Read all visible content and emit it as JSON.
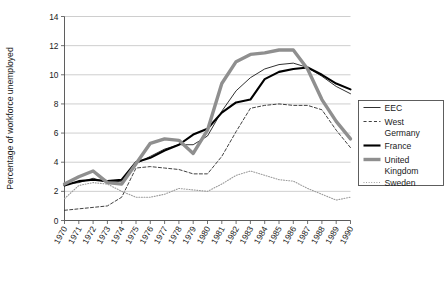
{
  "chart_data": {
    "type": "line",
    "title": "",
    "xlabel": "",
    "ylabel": "Percentage of workforce unemployed",
    "ylim": [
      0,
      14
    ],
    "yticks": [
      0,
      2,
      4,
      6,
      8,
      10,
      12,
      14
    ],
    "ytick_labels": [
      "0",
      "2",
      "4",
      "6",
      "8",
      "10",
      "12",
      "14"
    ],
    "grid": true,
    "grid_axis": "y",
    "legend_position": "right",
    "x": [
      1970,
      1971,
      1972,
      1973,
      1974,
      1975,
      1976,
      1977,
      1978,
      1979,
      1980,
      1981,
      1982,
      1983,
      1984,
      1985,
      1986,
      1987,
      1988,
      1989,
      1990
    ],
    "categories": [
      "1970",
      "1971",
      "1972",
      "1973",
      "1974",
      "1975",
      "1976",
      "1977",
      "1978",
      "1979",
      "1980",
      "1981",
      "1982",
      "1983",
      "1984",
      "1985",
      "1986",
      "1987",
      "1988",
      "1989",
      "1990"
    ],
    "series": [
      {
        "name": "EEC",
        "style": "solid-thin",
        "color": "#1a1a1a",
        "width": 0.9,
        "values": [
          2.5,
          2.6,
          2.9,
          2.6,
          2.7,
          3.9,
          4.4,
          4.9,
          5.2,
          5.2,
          5.8,
          7.5,
          8.9,
          9.8,
          10.4,
          10.7,
          10.8,
          10.5,
          9.9,
          9.2,
          8.7
        ]
      },
      {
        "name": "West Germany",
        "style": "dashed",
        "color": "#2b2b2b",
        "width": 0.9,
        "values": [
          0.7,
          0.8,
          0.9,
          1.0,
          1.6,
          3.6,
          3.7,
          3.6,
          3.5,
          3.2,
          3.2,
          4.4,
          6.1,
          7.7,
          7.9,
          8.0,
          7.9,
          7.9,
          7.6,
          6.2,
          5.0
        ]
      },
      {
        "name": "France",
        "style": "solid-thick",
        "color": "#000000",
        "width": 2.1,
        "values": [
          2.4,
          2.7,
          2.8,
          2.7,
          2.8,
          4.0,
          4.3,
          4.8,
          5.2,
          5.9,
          6.3,
          7.4,
          8.1,
          8.3,
          9.7,
          10.2,
          10.4,
          10.5,
          10.0,
          9.4,
          9.0
        ]
      },
      {
        "name": "United Kingdom",
        "style": "solid-thick-gray",
        "color": "#8f8f8f",
        "width": 3.4,
        "values": [
          2.5,
          3.0,
          3.4,
          2.6,
          2.5,
          3.9,
          5.3,
          5.6,
          5.5,
          4.6,
          6.2,
          9.4,
          10.9,
          11.4,
          11.5,
          11.7,
          11.7,
          10.4,
          8.3,
          6.8,
          5.6
        ]
      },
      {
        "name": "Sweden",
        "style": "dotted",
        "color": "#9a9a9a",
        "width": 1.1,
        "values": [
          1.5,
          2.4,
          2.6,
          2.5,
          2.0,
          1.6,
          1.6,
          1.8,
          2.2,
          2.1,
          2.0,
          2.5,
          3.1,
          3.4,
          3.1,
          2.8,
          2.7,
          2.2,
          1.8,
          1.4,
          1.6
        ]
      }
    ]
  },
  "legend": {
    "entries": [
      {
        "label": "EEC",
        "label_line2": ""
      },
      {
        "label": "West",
        "label_line2": "Germany"
      },
      {
        "label": "France",
        "label_line2": ""
      },
      {
        "label": "United",
        "label_line2": "Kingdom"
      },
      {
        "label": "Sweden",
        "label_line2": ""
      }
    ]
  },
  "colors": {
    "eec": "#1a1a1a",
    "west_germany": "#2b2b2b",
    "france": "#000000",
    "united_kingdom": "#8f8f8f",
    "sweden": "#9a9a9a",
    "gridline": "#b9b9b9",
    "axis": "#4d4d4d",
    "background": "#ffffff"
  }
}
